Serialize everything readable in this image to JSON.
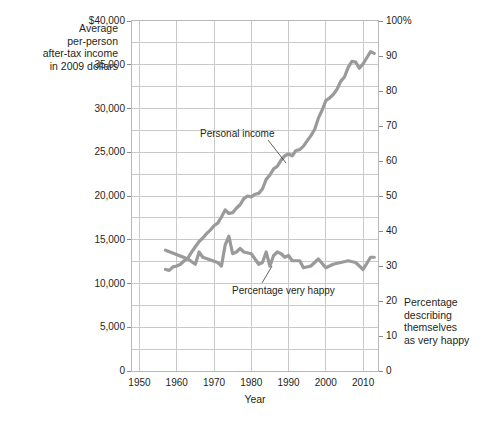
{
  "chart_data": {
    "type": "line",
    "title": "",
    "xlabel": "Year",
    "ylabel_left": "Average per-person after-tax income in 2009 dollars",
    "ylabel_right": "Percentage describing themselves as very happy",
    "xlim": [
      1948,
      2014
    ],
    "xticks": [
      1950,
      1960,
      1970,
      1980,
      1990,
      2000,
      2010
    ],
    "xtick_labels": [
      "1950",
      "1960",
      "1970",
      "1980",
      "1990",
      "2000",
      "2010"
    ],
    "ylim_left": [
      0,
      40000
    ],
    "yticks_left": [
      0,
      5000,
      10000,
      15000,
      20000,
      25000,
      30000,
      35000,
      40000
    ],
    "ytick_labels_left": [
      "0",
      "5,000",
      "10,000",
      "15,000",
      "20,000",
      "25,000",
      "30,000",
      "35,000",
      "$40,000"
    ],
    "ylim_right": [
      0,
      100
    ],
    "yticks_right": [
      0,
      10,
      20,
      30,
      40,
      50,
      60,
      70,
      80,
      90,
      100
    ],
    "ytick_labels_right": [
      "0",
      "10",
      "20",
      "30",
      "40",
      "50",
      "60",
      "70",
      "80",
      "90",
      "100%"
    ],
    "grid": true,
    "grid_x_step": 10,
    "grid_y_step_left": 2500,
    "legend_position": "inline-annotations",
    "line_color": "#9a9a9a",
    "grid_color": "#c9c9c9",
    "frame_color": "#b9b9b9",
    "series": [
      {
        "name": "Personal income",
        "axis": "left",
        "x": [
          1957,
          1958,
          1959,
          1960,
          1961,
          1962,
          1963,
          1964,
          1965,
          1966,
          1967,
          1968,
          1969,
          1970,
          1971,
          1972,
          1973,
          1974,
          1975,
          1976,
          1977,
          1978,
          1979,
          1980,
          1981,
          1982,
          1983,
          1984,
          1985,
          1986,
          1987,
          1988,
          1989,
          1990,
          1991,
          1992,
          1993,
          1994,
          1995,
          1996,
          1997,
          1998,
          1999,
          2000,
          2001,
          2002,
          2003,
          2004,
          2005,
          2006,
          2007,
          2008,
          2009,
          2010,
          2011,
          2012,
          2013
        ],
        "values": [
          11600,
          11500,
          11900,
          12000,
          12200,
          12600,
          12900,
          13600,
          14200,
          14800,
          15200,
          15700,
          16100,
          16600,
          16900,
          17600,
          18400,
          18000,
          18100,
          18600,
          19000,
          19700,
          20000,
          19900,
          20200,
          20300,
          20800,
          21900,
          22400,
          23100,
          23400,
          24100,
          24600,
          24800,
          24600,
          25200,
          25300,
          25700,
          26300,
          26900,
          27600,
          28900,
          29800,
          30900,
          31200,
          31600,
          32200,
          33100,
          33600,
          34700,
          35400,
          35300,
          34600,
          35100,
          35800,
          36500,
          36300
        ]
      },
      {
        "name": "Percentage very happy",
        "axis": "right",
        "x": [
          1957,
          1963,
          1965,
          1966,
          1967,
          1971,
          1972,
          1973,
          1974,
          1975,
          1976,
          1977,
          1978,
          1980,
          1982,
          1983,
          1984,
          1985,
          1986,
          1987,
          1988,
          1989,
          1990,
          1991,
          1993,
          1994,
          1996,
          1998,
          2000,
          2002,
          2004,
          2006,
          2008,
          2010,
          2012,
          2013
        ],
        "values": [
          34.5,
          32.0,
          30.5,
          34.0,
          32.5,
          31.0,
          30.0,
          36.0,
          38.5,
          33.5,
          34.0,
          35.0,
          34.0,
          33.5,
          30.5,
          31.0,
          34.0,
          30.0,
          33.0,
          34.0,
          33.5,
          32.5,
          33.0,
          31.5,
          31.5,
          29.5,
          30.0,
          32.0,
          29.5,
          30.5,
          31.0,
          31.5,
          31.0,
          29.0,
          32.5,
          32.5
        ]
      }
    ],
    "annotations": [
      {
        "text": "Personal income",
        "x": 1977,
        "y": 27500
      },
      {
        "text": "Percentage very happy",
        "x": 1984,
        "y": 10500
      }
    ]
  },
  "figure": {
    "left_axis_title": "Average\nper-person\nafter-tax income\nin 2009 dollars",
    "left_axis_title_lines": [
      "Average",
      "per-person",
      "after-tax income",
      "in 2009 dollars"
    ],
    "right_axis_title_lines": [
      "Percentage",
      "describing",
      "themselves",
      "as very happy"
    ],
    "x_axis_title": "Year",
    "annotation_income": "Personal income",
    "annotation_happy": "Percentage very happy"
  }
}
